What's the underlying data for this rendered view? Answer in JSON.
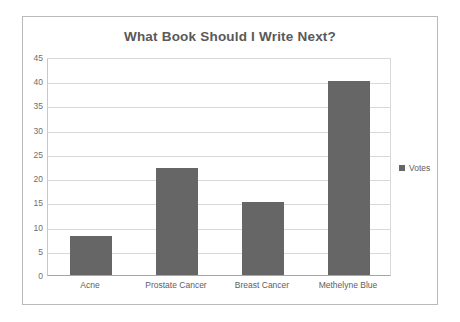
{
  "chart_data": {
    "type": "bar",
    "title": "What Book Should I Write Next?",
    "categories": [
      "Acne",
      "Prostate Cancer",
      "Breast Cancer",
      "Methelyne Blue"
    ],
    "values": [
      8,
      22,
      15,
      40
    ],
    "series": [
      {
        "name": "Votes",
        "values": [
          8,
          22,
          15,
          40
        ]
      }
    ],
    "xlabel": "",
    "ylabel": "",
    "ylim": [
      0,
      45
    ],
    "ytick_step": 5,
    "yticks": [
      45,
      40,
      35,
      30,
      25,
      20,
      15,
      10,
      5,
      0
    ],
    "grid": true,
    "legend": {
      "position": "right",
      "entries": [
        "Votes"
      ]
    },
    "colors": {
      "bar": "#666666",
      "gridline": "#d9d9d9",
      "axis": "#a6a6a6",
      "title_text": "#595959",
      "tick_text": "#6e6e6e",
      "frame_border": "#b9b9b9",
      "background": "#ffffff"
    }
  }
}
